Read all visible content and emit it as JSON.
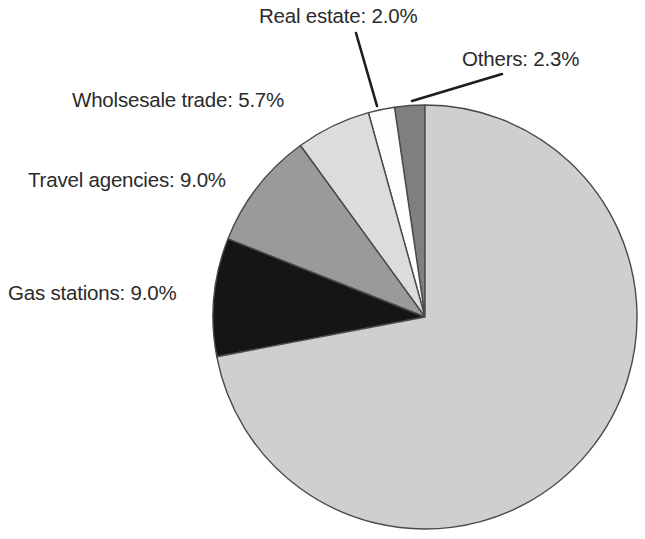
{
  "chart_data": {
    "type": "pie",
    "title": "",
    "subtitle": "",
    "xlabel": "",
    "ylabel": "",
    "legend_position": "none",
    "grid": false,
    "units": "percent",
    "center": {
      "x": 425,
      "y": 317
    },
    "radius": 212,
    "start_angle_deg": 90,
    "direction": "counterclockwise",
    "categories": [
      "Others",
      "Real estate",
      "Wholsesale trade",
      "Travel agencies",
      "Gas stations",
      "Remainder"
    ],
    "values": [
      2.3,
      2.0,
      5.7,
      9.0,
      9.0,
      72.0
    ],
    "slices": [
      {
        "name": "Others",
        "value": 2.3,
        "label": "Others: 2.3%",
        "color": "#7f7f7f",
        "labelled": true
      },
      {
        "name": "Real estate",
        "value": 2.0,
        "label": "Real estate: 2.0%",
        "color": "#fdfdfd",
        "labelled": true
      },
      {
        "name": "Wholsesale trade",
        "value": 5.7,
        "label": "Wholsesale trade: 5.7%",
        "color": "#dcdcdc",
        "labelled": true
      },
      {
        "name": "Travel agencies",
        "value": 9.0,
        "label": "Travel agencies: 9.0%",
        "color": "#9a9a9a",
        "labelled": true
      },
      {
        "name": "Gas stations",
        "value": 9.0,
        "label": "Gas stations: 9.0%",
        "color": "#151515",
        "labelled": true
      },
      {
        "name": "Remainder",
        "value": 72.0,
        "label": "",
        "color": "#cfcfcf",
        "labelled": false
      }
    ],
    "leader_lines": [
      {
        "name": "real-estate",
        "x1": 356,
        "y1": 33,
        "x2": 377,
        "y2": 106
      },
      {
        "name": "others",
        "x1": 502,
        "y1": 74,
        "x2": 412,
        "y2": 101
      }
    ]
  },
  "labels": {
    "real_estate": "Real estate: 2.0%",
    "others": "Others: 2.3%",
    "wholesale_trade": "Wholsesale trade: 5.7%",
    "travel_agencies": "Travel agencies: 9.0%",
    "gas_stations": "Gas stations: 9.0%"
  },
  "colors": {
    "background": "#ffffff",
    "slice_outline": "#4a4a4a",
    "leader_line": "#1d1d1d",
    "label_text": "#2b2b2b"
  }
}
